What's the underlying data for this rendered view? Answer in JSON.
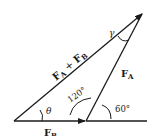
{
  "diagram": {
    "type": "vector-triangle",
    "vectors": {
      "resultant": {
        "label_main": "F",
        "sub1": "A",
        "plus": " + ",
        "label_main2": "F",
        "sub2": "B"
      },
      "fa": {
        "label_main": "F",
        "sub": "A"
      },
      "fb": {
        "label_main": "F",
        "sub": "B"
      }
    },
    "angles": {
      "theta": "θ",
      "gamma": "γ",
      "interior": "120°",
      "exterior": "60°"
    },
    "colors": {
      "ink": "#1a1a1a",
      "background": "#ffffff"
    }
  }
}
